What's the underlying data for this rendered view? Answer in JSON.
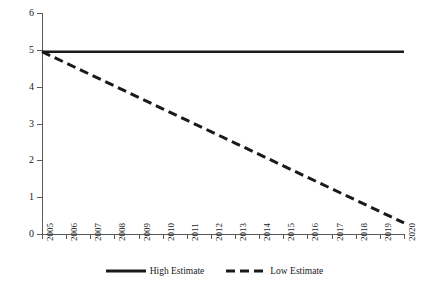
{
  "chart_data": {
    "type": "line",
    "title": "",
    "subtitle": "",
    "xlabel": "",
    "ylabel": "",
    "xlim": [
      2005,
      2020
    ],
    "ylim": [
      0,
      6
    ],
    "grid": false,
    "legend_position": "bottom-center",
    "x": [
      2005,
      2006,
      2007,
      2008,
      2009,
      2010,
      2011,
      2012,
      2013,
      2014,
      2015,
      2016,
      2017,
      2018,
      2019,
      2020
    ],
    "xtick_labels": [
      "2005",
      "2006",
      "2007",
      "2008",
      "2009",
      "2010",
      "2011",
      "2012",
      "2013",
      "2014",
      "2015",
      "2016",
      "2017",
      "2018",
      "2019",
      "2020"
    ],
    "ytick_labels": [
      "0",
      "1",
      "2",
      "3",
      "4",
      "5",
      "6"
    ],
    "ytick_values": [
      0,
      1,
      2,
      3,
      4,
      5,
      6
    ],
    "series": [
      {
        "name": "High Estimate",
        "style": "solid",
        "color": "#1a1a1a",
        "width": 2.5,
        "values": [
          4.95,
          4.95,
          4.95,
          4.95,
          4.95,
          4.95,
          4.95,
          4.95,
          4.95,
          4.95,
          4.95,
          4.95,
          4.95,
          4.95,
          4.95,
          4.95
        ]
      },
      {
        "name": "Low Estimate",
        "style": "dashed",
        "color": "#1a1a1a",
        "width": 3,
        "values": [
          4.95,
          4.64,
          4.33,
          4.02,
          3.71,
          3.4,
          3.09,
          2.78,
          2.47,
          2.16,
          1.85,
          1.54,
          1.23,
          0.92,
          0.61,
          0.3
        ]
      }
    ],
    "legend": [
      {
        "label": "High Estimate",
        "style": "solid"
      },
      {
        "label": "Low Estimate",
        "style": "dashed"
      }
    ]
  },
  "colors": {
    "background": "#ffffff",
    "axis": "#5a5a5a",
    "text": "#1a1a1a",
    "series": "#1a1a1a"
  }
}
